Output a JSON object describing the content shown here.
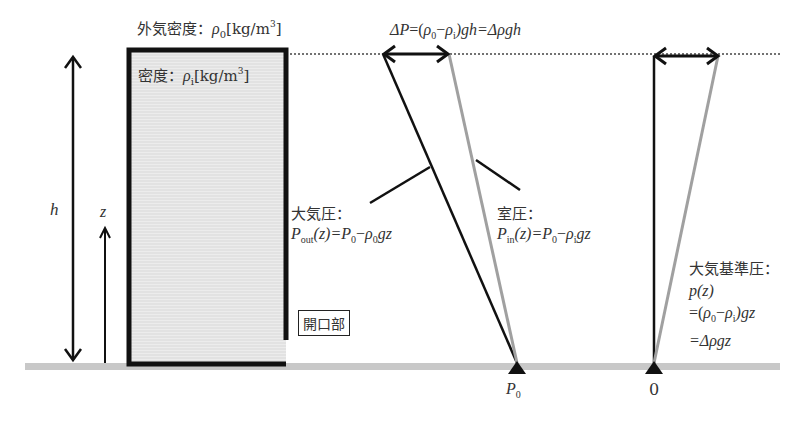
{
  "diagram": {
    "outside_density_label": {
      "prefix": "外気密度：",
      "symbol": "ρ",
      "sub": "0",
      "unit_open": "[kg/m",
      "unit_sup": "3",
      "unit_close": "]"
    },
    "inside_density_label": {
      "prefix": "密度：",
      "symbol": "ρ",
      "sub": "i",
      "unit_open": "[kg/m",
      "unit_sup": "3",
      "unit_close": "]"
    },
    "delta_p_formula": {
      "lhs": "ΔP",
      "eq1": "=(",
      "rho0": "ρ",
      "rho0_sub": "0",
      "minus": "−",
      "rhoi": "ρ",
      "rhoi_sub": "i",
      "rest": ")gh=Δρgh"
    },
    "height_label": "h",
    "z_label": "z",
    "opening_label": "開口部",
    "atmospheric_pressure": {
      "title": "大気圧：",
      "P": "P",
      "P_sub": "out",
      "arg": "(z)=",
      "P0": "P",
      "P0_sub": "0",
      "minus": "−",
      "rho": "ρ",
      "rho_sub": "0",
      "tail": "gz"
    },
    "room_pressure": {
      "title": "室圧：",
      "P": "P",
      "P_sub": "in",
      "arg": "(z)=",
      "P0": "P",
      "P0_sub": "0",
      "minus": "−",
      "rho": "ρ",
      "rho_sub": "i",
      "tail": "gz"
    },
    "reference_pressure": {
      "title": "大気基準圧：",
      "line1": "p(z)",
      "line2_open": "=(",
      "rho0": "ρ",
      "rho0_sub": "0",
      "minus": "−",
      "rhoi": "ρ",
      "rhoi_sub": "i",
      "line2_close": ")gz",
      "line3": "=Δρgz"
    },
    "base_labels": {
      "left_P": "P",
      "left_P_sub": "0",
      "right": "0"
    },
    "colors": {
      "line_dark": "#111111",
      "line_gray": "#a0a0a0",
      "ground": "#c8c8c8",
      "building_fill": "#e6e6e6",
      "text": "#333333"
    }
  }
}
